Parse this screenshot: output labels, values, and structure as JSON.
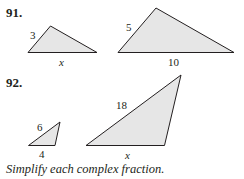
{
  "problems": [
    {
      "number": "91.",
      "triangles": [
        {
          "name": "small",
          "points": "28,52.5 50.5,26 97,52.5",
          "labels": [
            {
              "text": "3",
              "x": 30,
              "y": 39,
              "italic": false
            },
            {
              "text": "x",
              "x": 59,
              "y": 66,
              "italic": true
            }
          ]
        },
        {
          "name": "large",
          "points": "118,52.5 156,8 234,52.5",
          "labels": [
            {
              "text": "5",
              "x": 126,
              "y": 31,
              "italic": false
            },
            {
              "text": "10",
              "x": 168,
              "y": 66,
              "italic": false
            }
          ]
        }
      ]
    },
    {
      "number": "92.",
      "triangles": [
        {
          "name": "small",
          "points": "28.5,145.5 60,122 55,145.5",
          "labels": [
            {
              "text": "6",
              "x": 37,
              "y": 131,
              "italic": false
            },
            {
              "text": "4",
              "x": 39,
              "y": 158,
              "italic": false
            }
          ]
        },
        {
          "name": "large",
          "points": "86,145.5 181,75 164.5,145.5",
          "labels": [
            {
              "text": "18",
              "x": 116,
              "y": 109,
              "italic": false
            },
            {
              "text": "x",
              "x": 125,
              "y": 159,
              "italic": true
            }
          ]
        }
      ]
    }
  ],
  "instruction": "Simplify each complex fraction.",
  "colors": {
    "fill": "#e6e6e6",
    "stroke": "#231f20"
  }
}
